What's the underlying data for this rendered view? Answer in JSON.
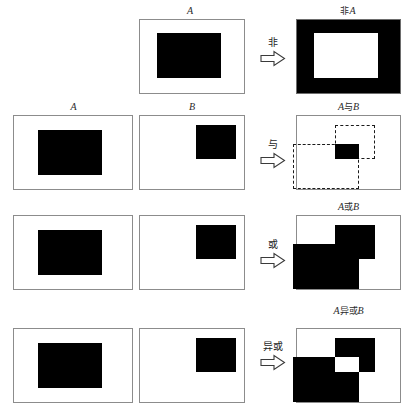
{
  "figure": {
    "title_present": false,
    "colors": {
      "foreground": "#000000",
      "background": "#ffffff",
      "panel_border": "#8c8c8c",
      "dashed_outline": "#1a1a1a",
      "label_text": "#2b2b2b"
    }
  },
  "rows": [
    {
      "id": "not",
      "operator_label": "非",
      "operands": [
        {
          "label": "A",
          "name": "operand-a-not"
        }
      ],
      "result_label_parts": {
        "prefix": "非",
        "operand": "A"
      },
      "result_label": "非A"
    },
    {
      "id": "and",
      "operator_label": "与",
      "operands": [
        {
          "label": "A",
          "name": "operand-a-and"
        },
        {
          "label": "B",
          "name": "operand-b-and"
        }
      ],
      "result_label_parts": {
        "left": "A",
        "op": "与",
        "right": "B"
      },
      "result_label": "A与B"
    },
    {
      "id": "or",
      "operator_label": "或",
      "operands": [
        {
          "label": "",
          "name": "operand-a-or"
        },
        {
          "label": "",
          "name": "operand-b-or"
        }
      ],
      "result_label_parts": {
        "left": "A",
        "op": "或",
        "right": "B"
      },
      "result_label": "A或B"
    },
    {
      "id": "xor",
      "operator_label": "异或",
      "operands": [
        {
          "label": "",
          "name": "operand-a-xor"
        },
        {
          "label": "",
          "name": "operand-b-xor"
        }
      ],
      "result_label_parts": {
        "left": "A",
        "op": "异或",
        "right": "B"
      },
      "result_label": "A异或B"
    }
  ],
  "arrow": {
    "icon": "rightwards-hollow-arrow-icon",
    "glyph": "⇨"
  }
}
